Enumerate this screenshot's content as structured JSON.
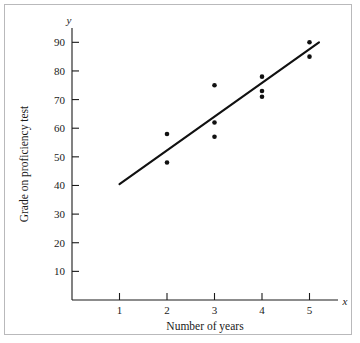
{
  "chart_data": {
    "type": "scatter",
    "title": "",
    "xlabel": "Number of years",
    "ylabel": "Grade on proficiency test",
    "x_axis_variable": "x",
    "y_axis_variable": "y",
    "grid": false,
    "legend": "none",
    "xlim": [
      0,
      5.6
    ],
    "ylim": [
      0,
      95
    ],
    "x_ticks": [
      1,
      2,
      3,
      4,
      5
    ],
    "x_tick_labels": [
      "1",
      "2",
      "3",
      "4",
      "5"
    ],
    "y_ticks": [
      10,
      20,
      30,
      40,
      50,
      60,
      70,
      80,
      90
    ],
    "y_tick_labels": [
      "10",
      "20",
      "30",
      "40",
      "50",
      "60",
      "70",
      "80",
      "90"
    ],
    "points": [
      {
        "x": 2,
        "y": 58
      },
      {
        "x": 2,
        "y": 48
      },
      {
        "x": 3,
        "y": 75
      },
      {
        "x": 3,
        "y": 62
      },
      {
        "x": 3,
        "y": 57
      },
      {
        "x": 4,
        "y": 78
      },
      {
        "x": 4,
        "y": 73
      },
      {
        "x": 4,
        "y": 71
      },
      {
        "x": 5,
        "y": 90
      },
      {
        "x": 5,
        "y": 85
      }
    ],
    "trend_line": {
      "type": "linear-regression",
      "x_start": 1.0,
      "y_start": 40.5,
      "x_end": 5.2,
      "y_end": 90.0
    },
    "colors": {
      "point": "#111111",
      "line": "#111111",
      "axis": "#1a1a1a",
      "frame": "#b9b9bb",
      "background": "#ffffff"
    }
  }
}
